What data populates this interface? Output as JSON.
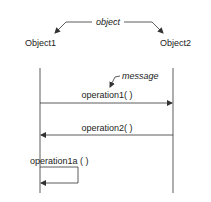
{
  "diagram": {
    "type": "sequence",
    "annotations": {
      "object_label": "object",
      "message_label": "message"
    },
    "objects": [
      {
        "name": "Object1"
      },
      {
        "name": "Object2"
      }
    ],
    "messages": [
      {
        "label": "operation1( )",
        "from": "Object1",
        "to": "Object2"
      },
      {
        "label": "operation2( )",
        "from": "Object2",
        "to": "Object1"
      },
      {
        "label": "operation1a ( )",
        "from": "Object1",
        "to": "Object1"
      }
    ],
    "colors": {
      "line": "#333333",
      "background": "#ffffff"
    }
  }
}
